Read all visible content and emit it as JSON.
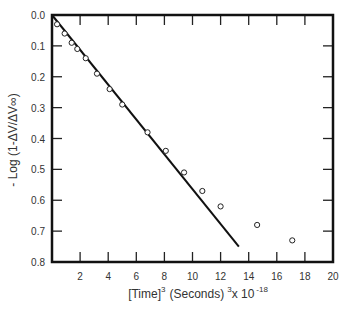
{
  "chart_data": {
    "type": "scatter",
    "title": "",
    "xlabel": "[Time]³ (Seconds)³x 10⁻¹⁸",
    "xlabel_parts": {
      "main": "[Time]",
      "sup1": "3",
      "mid": "(Seconds)",
      "sup2": "3",
      "tail": "x 10",
      "sup3": "-18"
    },
    "ylabel": "- Log (1-ΔV/ΔV∞)",
    "xlim": [
      0,
      20
    ],
    "ylim": [
      0.0,
      0.8
    ],
    "y_inverted": true,
    "x_ticks": [
      2,
      4,
      6,
      8,
      10,
      12,
      14,
      16,
      18,
      20
    ],
    "y_ticks": [
      "0.0",
      "0.1",
      "0.2",
      "0.3",
      "0.4",
      "0.5",
      "0.6",
      "0.7",
      "0.8"
    ],
    "grid": false,
    "legend": null,
    "series": [
      {
        "name": "data",
        "marker": "open-circle",
        "points": [
          [
            0.36,
            0.03
          ],
          [
            0.9,
            0.06
          ],
          [
            1.4,
            0.09
          ],
          [
            1.8,
            0.11
          ],
          [
            2.4,
            0.14
          ],
          [
            3.2,
            0.19
          ],
          [
            4.1,
            0.24
          ],
          [
            5.0,
            0.29
          ],
          [
            6.8,
            0.38
          ],
          [
            8.1,
            0.44
          ],
          [
            9.4,
            0.51
          ],
          [
            10.7,
            0.57
          ],
          [
            12.0,
            0.62
          ],
          [
            14.6,
            0.68
          ],
          [
            17.1,
            0.73
          ]
        ]
      },
      {
        "name": "fit",
        "type": "line",
        "points": [
          [
            0.0,
            0.0
          ],
          [
            13.3,
            0.75
          ]
        ]
      }
    ]
  }
}
